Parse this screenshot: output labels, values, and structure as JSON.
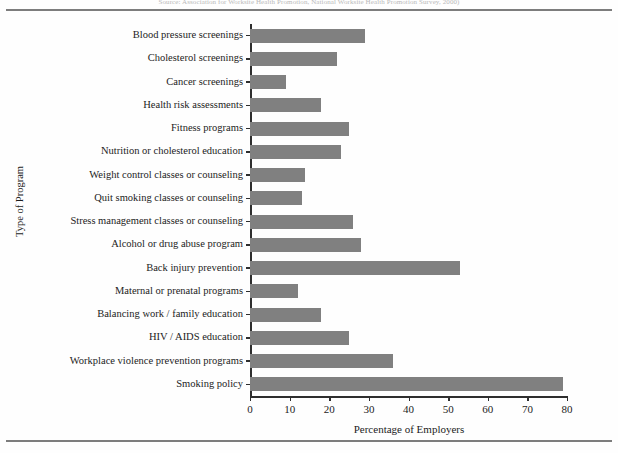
{
  "figure": {
    "source_note": "Source: Association for Worksite Health Promotion, National Worksite Health Promotion Survey, 2000)"
  },
  "chart_data": {
    "type": "bar",
    "orientation": "horizontal",
    "title": "",
    "xlabel": "Percentage of Employers",
    "ylabel": "Type of Program",
    "xlim": [
      0,
      80
    ],
    "xticks": [
      0,
      10,
      20,
      30,
      40,
      50,
      60,
      70,
      80
    ],
    "grid": false,
    "legend": false,
    "bar_color": "#808080",
    "categories": [
      "Blood pressure screenings",
      "Cholesterol screenings",
      "Cancer screenings",
      "Health risk assessments",
      "Fitness programs",
      "Nutrition or cholesterol education",
      "Weight control classes or counseling",
      "Quit smoking classes or counseling",
      "Stress management classes or counseling",
      "Alcohol or drug abuse program",
      "Back injury prevention",
      "Maternal or prenatal programs",
      "Balancing work / family education",
      "HIV / AIDS education",
      "Workplace violence prevention programs",
      "Smoking policy"
    ],
    "values": [
      29,
      22,
      9,
      18,
      25,
      23,
      14,
      13,
      26,
      28,
      53,
      12,
      18,
      25,
      36,
      79
    ]
  }
}
